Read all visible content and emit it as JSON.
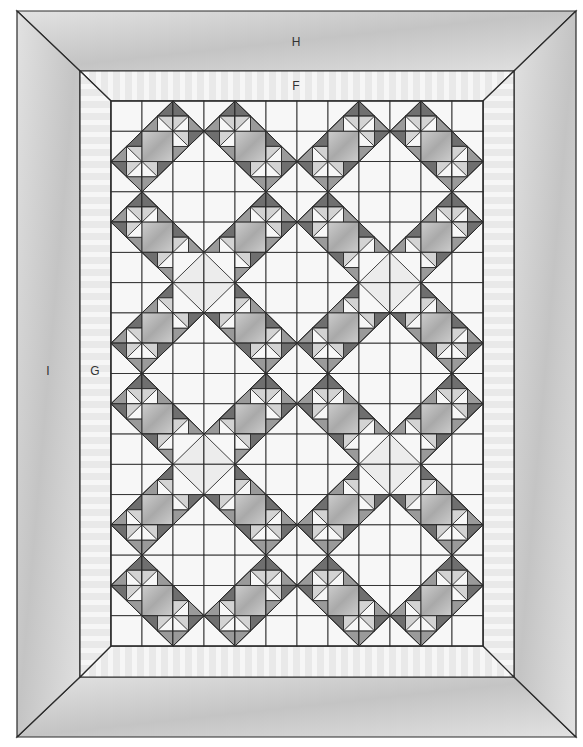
{
  "diagram": {
    "type": "quilt-layout",
    "labels": {
      "outer_border": "H",
      "inner_border_top": "F",
      "inner_border_side": "G",
      "outer_border_side": "I"
    },
    "label_positions": {
      "H": [
        296,
        42
      ],
      "F": [
        296,
        86
      ],
      "G": [
        95,
        371
      ],
      "I": [
        48,
        371
      ]
    },
    "frame": {
      "outer": {
        "x1": 17,
        "y1": 11,
        "x2": 576,
        "y2": 737
      },
      "inner_border": {
        "x1": 80,
        "y1": 71,
        "x2": 514,
        "y2": 677
      },
      "center": {
        "x1": 111,
        "y1": 101,
        "x2": 483,
        "y2": 646
      }
    },
    "grid": {
      "cols": 12,
      "rows": 18
    },
    "colors": {
      "outer_border": "#c4c4c4",
      "outer_border_light": "#e2e2e2",
      "inner_border": "#e9e9e9",
      "inner_stripe": "#f6f6f6",
      "white": "#f7f7f7",
      "gray_block": "#a9a9a9",
      "gray_block_light": "#cdcdcd",
      "dark_triangle": "#6f6f6f",
      "mid_triangle": "#9a9a9a",
      "light_triangle": "#d3d3d3",
      "line": "#2a2a2a"
    },
    "cells": [
      "W,BR,BL,BR,BL,W,W,BR,BL,BR,BL,W",
      "BR,G,TL,TR,G,BL,BR,G,TL,TR,G,BL",
      "TR,TL,W,W,TR,TL,TR,TL,W,W,TR,TL",
      "BR,BL,W,W,BR,BL,BR,BL,W,W,BR,BL",
      "TR,G,BL,BR,G,TL,TR,G,BL,BR,G,TL",
      "W,TR,DTL,DTR,TL,W,W,TR,DTL,DTR,TL,W",
      "W,BR,DBL,DBR,BL,W,W,BR,DBL,DBR,BL,W",
      "BR,G,TL,TR,G,BL,BR,G,TL,TR,G,BL",
      "TR,TL,W,W,TR,TL,TR,TL,W,W,TR,TL",
      "BR,BL,W,W,BR,BL,BR,BL,W,W,BR,BL",
      "TR,G,BL,BR,G,TL,TR,G,BL,BR,G,TL",
      "W,TR,DTL,DTR,TL,W,W,TR,DTL,DTR,TL,W",
      "W,BR,DBL,DBR,BL,W,W,BR,DBL,DBR,BL,W",
      "BR,G,TL,TR,G,BL,BR,G,TL,TR,G,BL",
      "TR,TL,W,W,TR,TL,TR,TL,W,W,TR,TL",
      "BR,BL,W,W,BR,BL,BR,BL,W,W,BR,BL",
      "TR,G,BL,BR,G,TL,TR,G,BL,BR,G,TL",
      "W,TR,TL,TR,TL,W,W,TR,TL,TR,TL,W"
    ]
  }
}
